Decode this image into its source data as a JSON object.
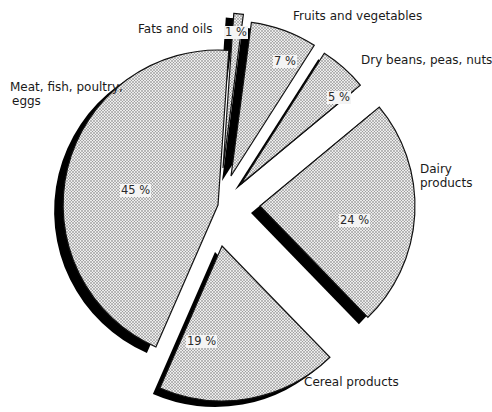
{
  "chart_data": {
    "type": "pie",
    "style": "exploded 3D pie with dotted-halftone fill and black shadow edges",
    "title": "",
    "categories": [
      "Fats and oils",
      "Fruits and vegetables",
      "Dry beans, peas, nuts",
      "Dairy products",
      "Cereal products",
      "Meat, fish, poultry, eggs"
    ],
    "values": [
      1,
      7,
      5,
      24,
      19,
      45
    ],
    "value_labels": [
      "1 %",
      "7 %",
      "5 %",
      "24 %",
      "19 %",
      "45 %"
    ],
    "unit": "%",
    "legend": "none (direct labels)"
  },
  "labels": {
    "fats": "Fats and oils",
    "fruits": "Fruits and vegetables",
    "beans": "Dry beans, peas, nuts",
    "dairy_line1": "Dairy",
    "dairy_line2": "products",
    "cereal": "Cereal products",
    "meat_line1": "Meat, fish, poultry,",
    "meat_line2": "eggs"
  },
  "colors": {
    "fill": "#e6e6e6",
    "dot": "#6e6e6e",
    "shadow": "#000000",
    "outline": "#111111"
  }
}
